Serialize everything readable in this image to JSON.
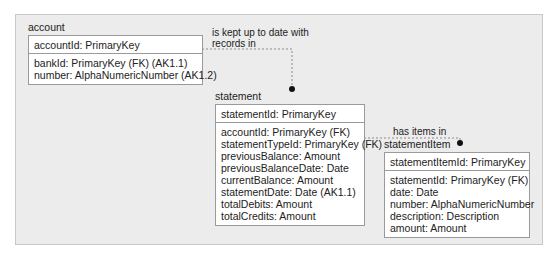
{
  "entities": {
    "account": {
      "name": "account",
      "primary_key": "accountId: PrimaryKey",
      "attributes": [
        "bankId: PrimaryKey (FK) (AK1.1)",
        "number: AlphaNumericNumber (AK1.2)"
      ]
    },
    "statement": {
      "name": "statement",
      "primary_key": "statementId: PrimaryKey",
      "attributes": [
        "accountId: PrimaryKey (FK)",
        "statementTypeId: PrimaryKey (FK)",
        "previousBalance: Amount",
        "previousBalanceDate: Date",
        "currentBalance: Amount",
        "statementDate: Date (AK1.1)",
        "totalDebits: Amount",
        "totalCredits: Amount"
      ]
    },
    "statementItem": {
      "name": "statementItem",
      "primary_key": "statementItemId: PrimaryKey",
      "attributes": [
        "statementId: PrimaryKey (FK)",
        "date: Date",
        "number: AlphaNumericNumber",
        "description: Description",
        "amount: Amount"
      ]
    }
  },
  "relationships": [
    {
      "from": "account",
      "to": "statement",
      "label_line1": "is kept up to date with",
      "label_line2": "records in"
    },
    {
      "from": "statement",
      "to": "statementItem",
      "label_line1": "has items in"
    }
  ],
  "colors": {
    "frame_bg": "#ececec",
    "box_border": "#9a9a9a",
    "line": "#8a8a8a",
    "dot": "#111111"
  }
}
